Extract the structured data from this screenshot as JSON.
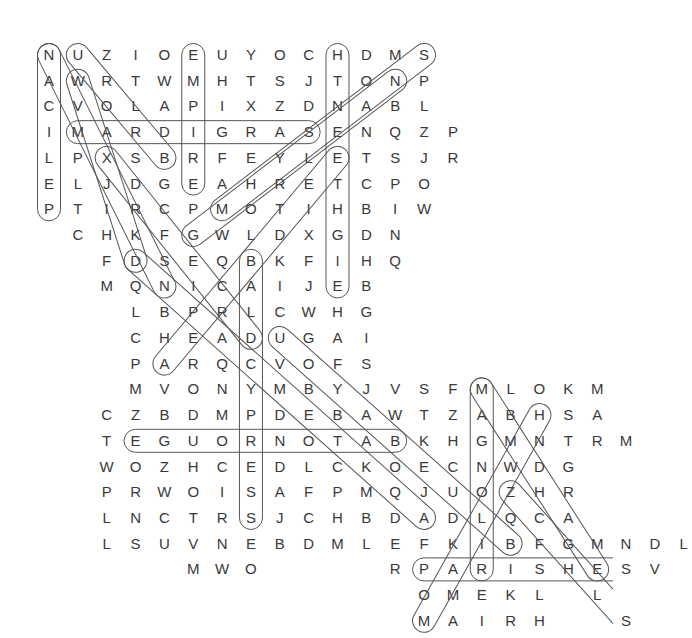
{
  "puzzle": {
    "kind": "word-search-grid",
    "geometry": {
      "origin_x": 49,
      "origin_y": 55,
      "col_step": 28.85,
      "row_step": 25.72,
      "rows": 23,
      "cols": 19
    },
    "grid_rows": [
      {
        "row": 1,
        "start_col": 1,
        "letters": "NUZIOEUYOCHDMS"
      },
      {
        "row": 2,
        "start_col": 1,
        "letters": "AWRTWMHTSJTONP"
      },
      {
        "row": 3,
        "start_col": 1,
        "letters": "CVOLAPIXZDNABL"
      },
      {
        "row": 4,
        "start_col": 1,
        "letters": "IMARDIGRASENQZP"
      },
      {
        "row": 5,
        "start_col": 1,
        "letters": "LPXSBRFEYLETSJR"
      },
      {
        "row": 6,
        "start_col": 1,
        "letters": "ELJDGEAHRETCPO"
      },
      {
        "row": 7,
        "start_col": 1,
        "letters": "PTIRCPMOTIHBIW"
      },
      {
        "row": 8,
        "start_col": 2,
        "letters": "CHKFGWLDXGDN"
      },
      {
        "row": 9,
        "start_col": 3,
        "letters": "FDSEQBKFIHQ"
      },
      {
        "row": 10,
        "start_col": 3,
        "letters": "MQNICAIJEB"
      },
      {
        "row": 11,
        "start_col": 4,
        "letters": "LBPRLCWHG"
      },
      {
        "row": 12,
        "start_col": 4,
        "letters": "CHEADUGAI"
      },
      {
        "row": 13,
        "start_col": 4,
        "letters": "PARQCVOFS"
      },
      {
        "row": 14,
        "start_col": 4,
        "letters": "MVONYMBYJVSFMLOKM"
      },
      {
        "row": 15,
        "start_col": 3,
        "letters": "CZBDMPDEBAWTZABHSA"
      },
      {
        "row": 16,
        "start_col": 3,
        "letters": "TEGUORNOTABKHGMNTRM"
      },
      {
        "row": 17,
        "start_col": 3,
        "letters": "WOZHCEDLCKOECNWDG"
      },
      {
        "row": 18,
        "start_col": 3,
        "letters": "PRWOISAFPMQJUOZHR"
      },
      {
        "row": 19,
        "start_col": 3,
        "letters": "LNCTRSJCHBDADLQCA"
      },
      {
        "row": 20,
        "start_col": 3,
        "letters": "LSUVNEBDMLEFKIBFGMNDL"
      },
      {
        "row": 21,
        "start_col": 6,
        "letters": "MWO"
      },
      {
        "row": 21,
        "start_col": 13,
        "letters": "RPARISHESV"
      },
      {
        "row": 22,
        "start_col": 14,
        "letters": "OMEKL"
      },
      {
        "row": 22,
        "start_col": 20,
        "letters": "L"
      },
      {
        "row": 23,
        "start_col": 14,
        "letters": "MAIRH"
      },
      {
        "row": 23,
        "start_col": 21,
        "letters": "S"
      }
    ],
    "found_words": [
      {
        "name": "pelican-vertical",
        "text": "NACILEP",
        "dir": "vertical",
        "r1": 1,
        "c1": 1,
        "r2": 7,
        "c2": 1
      },
      {
        "name": "empire-vertical",
        "text": "EMPIRE",
        "dir": "vertical",
        "r1": 1,
        "c1": 6,
        "r2": 6,
        "c2": 6
      },
      {
        "name": "eighteenth-vertical",
        "text": "HTNEETHGIE",
        "dir": "vertical",
        "r1": 1,
        "c1": 11,
        "r2": 10,
        "c2": 11
      },
      {
        "name": "mardigras-horizontal",
        "text": "MARDIGRAS",
        "dir": "horizontal",
        "r1": 4,
        "c1": 2,
        "r2": 4,
        "c2": 10
      },
      {
        "name": "baldcypress-vertical",
        "text": "BALDCYPRESS",
        "dir": "vertical",
        "r1": 9,
        "c1": 8,
        "r2": 19,
        "c2": 8
      },
      {
        "name": "magnolia-vertical",
        "text": "MAGNOLIA",
        "dir": "vertical",
        "r1": 14,
        "c1": 16,
        "r2": 21,
        "c2": 16
      },
      {
        "name": "batonrouge-horizontal",
        "text": "EGUORNOTAB",
        "dir": "horizontal",
        "r1": 16,
        "c1": 4,
        "r2": 16,
        "c2": 13
      },
      {
        "name": "parishes-horizontal",
        "text": "PARISHES",
        "dir": "horizontal",
        "r1": 21,
        "c1": 14,
        "r2": 21,
        "c2": 21
      },
      {
        "name": "diagonal-nuzio-1",
        "text": "NWOSIA",
        "dir": "diag-down-right",
        "r1": 1,
        "c1": 1,
        "r2": 10,
        "c2": 5
      },
      {
        "name": "diagonal-sebastian",
        "text": "SABINE",
        "dir": "diag-down-right",
        "r1": 1,
        "c1": 2,
        "r2": 5,
        "c2": 5
      },
      {
        "name": "diagonal-louisiana",
        "text": "ANAISIUOL",
        "dir": "diag-down-right",
        "r1": 2,
        "c1": 2,
        "r2": 9,
        "c2": 4
      },
      {
        "name": "diagonal-pontchar",
        "text": "SDHNEM",
        "dir": "diag-down-left",
        "r1": 1,
        "c1": 14,
        "r2": 7,
        "c2": 7
      },
      {
        "name": "diagonal-bayou",
        "text": "EUYOCH",
        "dir": "diag-down-left",
        "r1": 2,
        "c1": 13,
        "r2": 8,
        "c2": 6
      },
      {
        "name": "diagonal-creole",
        "text": "LETCPO",
        "dir": "diag-down-left",
        "r1": 5,
        "c1": 11,
        "r2": 13,
        "c2": 5
      },
      {
        "name": "diagonal-cajun",
        "text": "NPXSB",
        "dir": "diag-down-right",
        "r1": 5,
        "c1": 3,
        "r2": 12,
        "c2": 8
      },
      {
        "name": "diagonal-delta",
        "text": "SEQBK",
        "dir": "diag-down-right",
        "r1": 9,
        "c1": 4,
        "r2": 19,
        "c2": 14
      },
      {
        "name": "diagonal-dugau",
        "text": "UGAI",
        "dir": "diag-down-right",
        "r1": 12,
        "c1": 9,
        "r2": 20,
        "c2": 17
      },
      {
        "name": "diagonal-gumbo",
        "text": "MOGNW",
        "dir": "diag-down-right",
        "r1": 14,
        "c1": 16,
        "r2": 21,
        "c2": 20
      },
      {
        "name": "diagonal-shsa",
        "text": "SHESL",
        "dir": "diag-down-left",
        "r1": 15,
        "c1": 18,
        "r2": 23,
        "c2": 14
      },
      {
        "name": "diagonal-nwdg",
        "text": "HRCAB",
        "dir": "diag-down-right",
        "r1": 18,
        "c1": 17,
        "r2": 23,
        "c2": 21
      }
    ],
    "stroke_color": "#555555",
    "letter_color": "#3a3a3a",
    "background_color": "#ffffff"
  }
}
